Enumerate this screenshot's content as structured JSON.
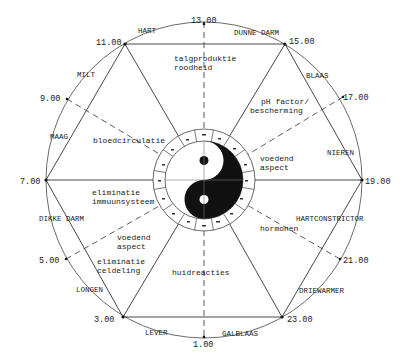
{
  "colors": {
    "ink": "#1a1a1a",
    "paper": "#ffffff",
    "line": "#333333"
  },
  "hours": {
    "h13": "13.00",
    "h15": "15.00",
    "h17": "17.00",
    "h19": "19.00",
    "h21": "21.00",
    "h23": "23.00",
    "h1": "1.00",
    "h3": "3.00",
    "h5": "5.00",
    "h7": "7.00",
    "h9": "9.00",
    "h11": "11.00"
  },
  "organs": {
    "hart": "HART",
    "dunne_darm": "DUNNE DARM",
    "blaas": "BLAAS",
    "nieren": "NIEREN",
    "hartconstrictor": "HARTCONSTRICTOR",
    "driewarmer": "DRIEWARMER",
    "galblaas": "GALBLAAS",
    "lever": "LEVER",
    "longen": "LONGEN",
    "dikke_darm": "DIKKE DARM",
    "maag": "MAAG",
    "milt": "MILT"
  },
  "functions": {
    "talgproduktie_1": "talgproduktie",
    "talgproduktie_2": "roodheid",
    "ph_1": "pH factor/",
    "ph_2": "bescherming",
    "voedend_r_1": "voedend",
    "voedend_r_2": "aspect",
    "hormonen": "hormonen",
    "huidreacties": "huidreacties",
    "elim_cel_1": "eliminatie",
    "elim_cel_2": "celdeling",
    "voedend_l_1": "voedend",
    "voedend_l_2": "aspect",
    "elim_imm_1": "eliminatie",
    "elim_imm_2": "immuunsysteem",
    "bloedcirculatie": "bloedcirculatie"
  },
  "center": {
    "symbol": "yin-yang"
  }
}
